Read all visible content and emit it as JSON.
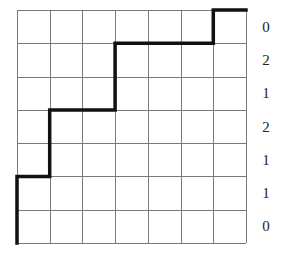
{
  "diagram": {
    "grid": {
      "columns": 7,
      "rows": 7,
      "line_color": "#7a7a7a"
    },
    "staircase_path": {
      "color": "#111111",
      "description": "Monotone lattice path from bottom-left corner to top-right corner",
      "steps_up_per_column": [
        2,
        0,
        2,
        0,
        0,
        0,
        1
      ],
      "vertices": [
        [
          0,
          0
        ],
        [
          0,
          2
        ],
        [
          1,
          2
        ],
        [
          1,
          4
        ],
        [
          3,
          4
        ],
        [
          3,
          6
        ],
        [
          6,
          6
        ],
        [
          6,
          7
        ],
        [
          7,
          7
        ]
      ]
    },
    "row_labels": [
      "0",
      "2",
      "1",
      "2",
      "1",
      "1",
      "0"
    ]
  }
}
